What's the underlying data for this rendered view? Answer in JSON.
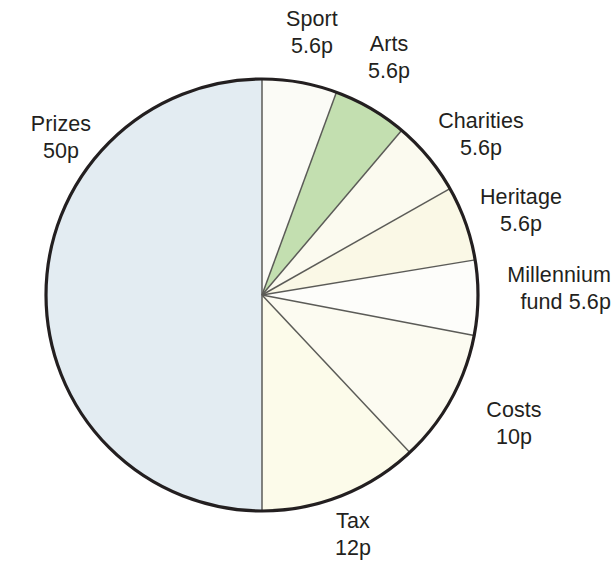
{
  "chart_data": {
    "type": "pie",
    "title": "",
    "unit": "p",
    "total": 100,
    "center": {
      "x": 262,
      "y": 295
    },
    "radius": 216,
    "start_angle_deg": 0,
    "direction": "clockwise",
    "categories": [
      "Sport",
      "Arts",
      "Charities",
      "Heritage",
      "Millennium fund",
      "Costs",
      "Tax",
      "Prizes"
    ],
    "values": [
      5.6,
      5.6,
      5.6,
      5.6,
      5.6,
      10,
      12,
      50
    ],
    "value_labels": [
      "5.6p",
      "5.6p",
      "5.6p",
      "5.6p",
      "5.6p",
      "10p",
      "12p",
      "50p"
    ],
    "colors": [
      "#fbfbf6",
      "#c3dfb0",
      "#fbfaef",
      "#faf8e6",
      "#fdfdfa",
      "#fcfbf1",
      "#fcfbea",
      "#e3ecf2"
    ],
    "slices": [
      {
        "name": "Sport",
        "value": 5.6,
        "value_label": "5.6p",
        "color": "#fbfbf6",
        "start_deg": 0.0,
        "end_deg": 20.16
      },
      {
        "name": "Arts",
        "value": 5.6,
        "value_label": "5.6p",
        "color": "#c3dfb0",
        "start_deg": 20.16,
        "end_deg": 40.32
      },
      {
        "name": "Charities",
        "value": 5.6,
        "value_label": "5.6p",
        "color": "#fbfaef",
        "start_deg": 40.32,
        "end_deg": 60.48
      },
      {
        "name": "Heritage",
        "value": 5.6,
        "value_label": "5.6p",
        "color": "#faf8e6",
        "start_deg": 60.48,
        "end_deg": 80.64
      },
      {
        "name": "Millennium fund",
        "value": 5.6,
        "value_label": "5.6p",
        "color": "#fdfdfa",
        "start_deg": 80.64,
        "end_deg": 100.8
      },
      {
        "name": "Costs",
        "value": 10,
        "value_label": "10p",
        "color": "#fcfbf1",
        "start_deg": 100.8,
        "end_deg": 136.8
      },
      {
        "name": "Tax",
        "value": 12,
        "value_label": "12p",
        "color": "#fcfbea",
        "start_deg": 136.8,
        "end_deg": 180.0
      },
      {
        "name": "Prizes",
        "value": 50,
        "value_label": "50p",
        "color": "#e3ecf2",
        "start_deg": 180.0,
        "end_deg": 360.0
      }
    ],
    "legend": "none",
    "grid": false,
    "outline_color": "#231f20",
    "divider_color": "#5b5b57"
  },
  "labels": {
    "sport": {
      "name": "Sport",
      "value": "5.6p"
    },
    "arts": {
      "name": "Arts",
      "value": "5.6p"
    },
    "charities": {
      "name": "Charities",
      "value": "5.6p"
    },
    "heritage": {
      "name": "Heritage",
      "value": "5.6p"
    },
    "millennium": {
      "name": "Millennium",
      "value": "fund 5.6p"
    },
    "costs": {
      "name": "Costs",
      "value": "10p"
    },
    "tax": {
      "name": "Tax",
      "value": "12p"
    },
    "prizes": {
      "name": "Prizes",
      "value": "50p"
    }
  }
}
